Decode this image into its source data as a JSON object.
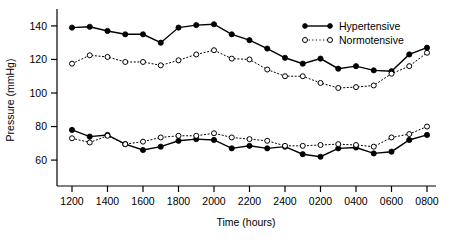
{
  "chart_data": {
    "type": "line",
    "title": "",
    "subtitle": "",
    "xlabel": "Time (hours)",
    "ylabel": "Pressure (mmHg)",
    "xlim": [
      1200,
      3200
    ],
    "ylim": [
      52,
      148
    ],
    "yticks": [
      60,
      80,
      100,
      120,
      140
    ],
    "ytick_labels": [
      "60",
      "80",
      "100",
      "120",
      "140"
    ],
    "grid": false,
    "legend_position": "top-right",
    "x": [
      1200,
      1300,
      1400,
      1500,
      1600,
      1700,
      1800,
      1900,
      2000,
      2100,
      2200,
      2300,
      2400,
      100,
      200,
      300,
      400,
      500,
      600,
      700,
      800
    ],
    "xticks": [
      1200,
      1400,
      1600,
      1800,
      2000,
      2200,
      2400,
      200,
      400,
      600,
      800
    ],
    "xtick_labels": [
      "1200",
      "1400",
      "1600",
      "1800",
      "2000",
      "2200",
      "2400",
      "0200",
      "0400",
      "0600",
      "0800"
    ],
    "series": [
      {
        "name": "Hypertensive",
        "measure": "systolic",
        "marker": "filled-circle",
        "linestyle": "solid",
        "color": "#000000",
        "values": [
          139,
          139.5,
          137,
          135,
          135,
          130,
          139,
          140.5,
          141,
          135,
          131.5,
          126.5,
          121,
          117.5,
          120.5,
          114.5,
          116,
          113.5,
          113,
          123,
          127
        ]
      },
      {
        "name": "Normotensive",
        "measure": "systolic",
        "marker": "open-circle",
        "linestyle": "dotted",
        "color": "#000000",
        "values": [
          117.5,
          122.5,
          121.5,
          118.5,
          118.5,
          116.5,
          119.5,
          123,
          125.5,
          120.5,
          120,
          114,
          110,
          110,
          106,
          103,
          103.5,
          104.5,
          111.5,
          116,
          124
        ]
      },
      {
        "name": "Hypertensive",
        "measure": "diastolic",
        "marker": "filled-circle",
        "linestyle": "solid",
        "color": "#000000",
        "values": [
          78,
          74,
          75,
          69.5,
          66,
          68,
          71.5,
          72.5,
          72,
          67,
          68.5,
          67,
          68,
          63.5,
          62,
          67,
          67.5,
          64,
          65,
          72,
          75
        ]
      },
      {
        "name": "Normotensive",
        "measure": "diastolic",
        "marker": "open-circle",
        "linestyle": "dotted",
        "color": "#000000",
        "values": [
          73,
          70.5,
          74.5,
          69.5,
          71,
          73.5,
          74.5,
          74.5,
          76,
          73.5,
          72.5,
          71.5,
          68.5,
          68.5,
          69,
          69.5,
          69,
          68,
          73.5,
          75.5,
          80
        ]
      }
    ],
    "legend": [
      {
        "label": "Hypertensive",
        "marker": "filled-circle",
        "linestyle": "solid"
      },
      {
        "label": "Normotensive",
        "marker": "open-circle",
        "linestyle": "dotted"
      }
    ]
  }
}
